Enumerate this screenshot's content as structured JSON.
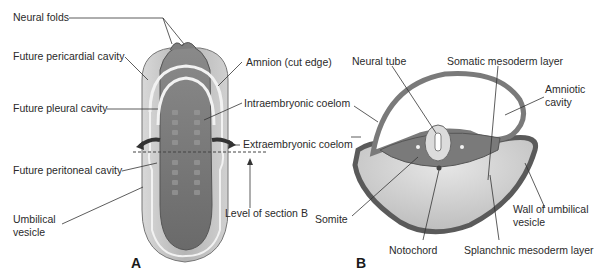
{
  "figure": {
    "panel_a": {
      "letter": "A",
      "labels": {
        "neural_folds": "Neural folds",
        "future_pericardial": "Future pericardial cavity",
        "future_pleural": "Future pleural cavity",
        "future_peritoneal": "Future peritoneal cavity",
        "umbilical_vesicle_1": "Umbilical",
        "umbilical_vesicle_2": "vesicle",
        "amnion": "Amnion (cut edge)",
        "intraembryonic": "Intraembryonic coelom",
        "extraembryonic": "Extraembryonic coelom",
        "level_section": "Level of section B"
      }
    },
    "panel_b": {
      "letter": "B",
      "labels": {
        "neural_tube": "Neural tube",
        "somatic": "Somatic mesoderm layer",
        "amniotic_1": "Amniotic",
        "amniotic_2": "cavity",
        "somite": "Somite",
        "notochord": "Notochord",
        "splanchnic": "Splanchnic mesoderm layer",
        "wall_umbilical_1": "Wall of umbilical",
        "wall_umbilical_2": "vesicle"
      }
    },
    "colors": {
      "embryo_dark": "#6e6e6e",
      "embryo_mid": "#8f8f8f",
      "vesicle_light": "#c9c9c9",
      "outline": "#4a4a4a",
      "leader": "#333333"
    }
  }
}
